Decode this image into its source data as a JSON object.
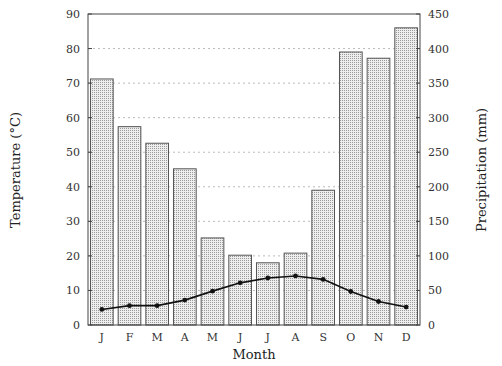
{
  "chart_data": {
    "type": "bar",
    "title": "",
    "xlabel": "Month",
    "ylabel": "Temperature (°C)",
    "y2label": "Precipitation (mm)",
    "categories": [
      "J",
      "F",
      "M",
      "A",
      "M",
      "J",
      "J",
      "A",
      "S",
      "O",
      "N",
      "D"
    ],
    "series": [
      {
        "name": "Precipitation (mm)",
        "type": "bar",
        "axis": "right",
        "values": [
          356,
          287,
          263,
          226,
          126,
          101,
          90,
          104,
          195,
          395,
          386,
          430
        ]
      },
      {
        "name": "Temperature (°C)",
        "type": "line",
        "axis": "left",
        "values": [
          4.5,
          5.6,
          5.6,
          7.2,
          9.8,
          12.2,
          13.6,
          14.2,
          13.2,
          9.7,
          6.8,
          5.2
        ]
      }
    ],
    "ylim": [
      0,
      90
    ],
    "y2lim": [
      0,
      450
    ],
    "yticks": [
      0,
      10,
      20,
      30,
      40,
      50,
      60,
      70,
      80,
      90
    ],
    "y2ticks": [
      0,
      50,
      100,
      150,
      200,
      250,
      300,
      350,
      400,
      450
    ],
    "grid": "horizontal dotted",
    "legend": "none"
  },
  "colors": {
    "bar_fill": "#e4e4e4",
    "bar_stroke": "#555555",
    "line": "#111111",
    "grid": "#bbbbbb",
    "axis": "#444444"
  }
}
